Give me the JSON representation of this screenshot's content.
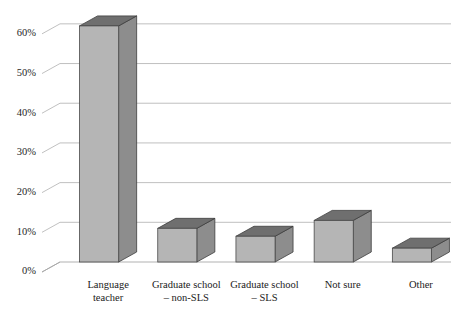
{
  "chart_data": {
    "type": "bar",
    "title": "",
    "subtitle": "",
    "xlabel": "",
    "ylabel": "",
    "categories": [
      "Language\nteacher",
      "Graduate school\n– non-SLS",
      "Graduate school\n– SLS",
      "Not sure",
      "Other"
    ],
    "category_lines": [
      [
        "Language",
        "teacher"
      ],
      [
        "Graduate school",
        "– non-SLS"
      ],
      [
        "Graduate school",
        "– SLS"
      ],
      [
        "Not sure",
        ""
      ],
      [
        "Other",
        ""
      ]
    ],
    "values": [
      62,
      11,
      9,
      13,
      6
    ],
    "ylim": [
      0,
      65
    ],
    "ytick_values": [
      0,
      10,
      20,
      30,
      40,
      50,
      60
    ],
    "ytick_labels": [
      "0%",
      "10%",
      "20%",
      "30%",
      "40%",
      "50%",
      "60%"
    ],
    "grid": true,
    "legend": "none",
    "style": "3d-column",
    "colors": {
      "bar_front": "#b5b5b5",
      "bar_top": "#6f6f6f",
      "bar_side": "#8d8d8d",
      "bar_outline": "#3d3d3d",
      "gridline": "#b9b9b9",
      "axis": "#a8a8a8",
      "background": "#ffffff",
      "text": "#1a1a1a"
    }
  }
}
